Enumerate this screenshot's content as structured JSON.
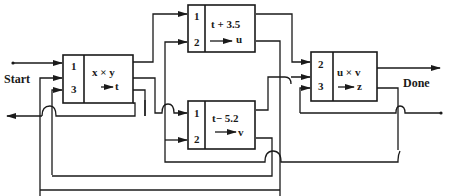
{
  "diagram": {
    "start_label": "Start",
    "done_label": "Done",
    "blocks": [
      {
        "id": "A",
        "ports": [
          "1",
          "3"
        ],
        "expr": "x × y",
        "output": "t"
      },
      {
        "id": "B",
        "ports": [
          "1",
          "2"
        ],
        "expr": "t + 3.5",
        "output": "u"
      },
      {
        "id": "C",
        "ports": [
          "1",
          "2"
        ],
        "expr": "t− 5.2",
        "output": "v"
      },
      {
        "id": "D",
        "ports": [
          "2",
          "3"
        ],
        "expr": "u × v",
        "output": "z"
      }
    ]
  }
}
